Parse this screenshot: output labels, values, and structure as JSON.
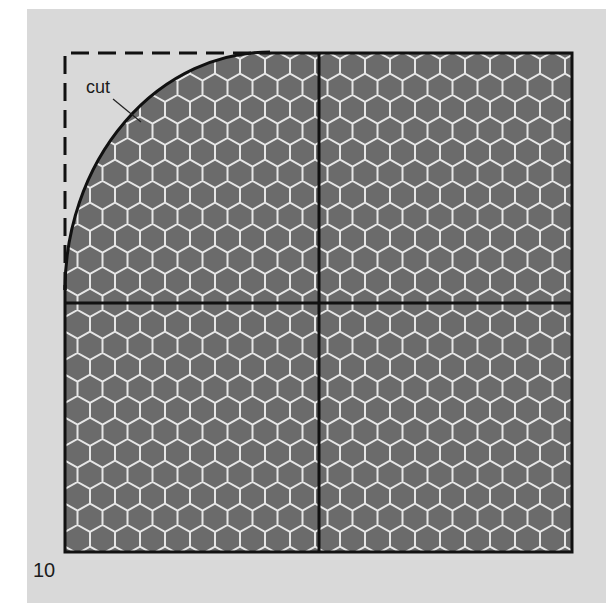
{
  "figure": {
    "number": "10",
    "labels": {
      "cut": "cut"
    },
    "colors": {
      "background": "#d9d9d9",
      "hex_fill": "#6b6b6b",
      "hex_line": "#e6e6e6",
      "outline": "#111111"
    }
  }
}
